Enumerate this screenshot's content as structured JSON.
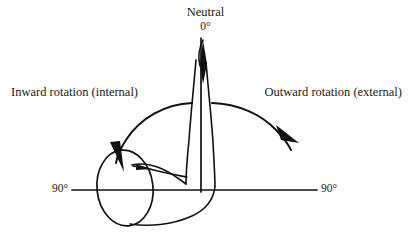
{
  "figure": {
    "title_label": "Neutral",
    "neutral_degrees": "0°",
    "left_label": "Inward rotation (internal)",
    "right_label": "Outward rotation (external)",
    "left_axis_degrees": "90°",
    "right_axis_degrees": "90°",
    "background_color": "#ffffff",
    "ink_color": "#111111"
  },
  "diagram_data": {
    "type": "anatomical-range-of-motion",
    "subject": "hip rotation",
    "neutral_axis": {
      "orientation": "vertical",
      "value": "0°",
      "label": "Neutral"
    },
    "range_axis": {
      "orientation": "horizontal",
      "left_value": "90°",
      "right_value": "90°"
    },
    "motions": [
      {
        "name": "Inward rotation (internal)",
        "direction": "left",
        "arc_sweep_degrees": 90,
        "arrow": "counterclockwise-to-left"
      },
      {
        "name": "Outward rotation (external)",
        "direction": "right",
        "arc_sweep_degrees": 90,
        "arrow": "clockwise-to-right"
      }
    ]
  }
}
